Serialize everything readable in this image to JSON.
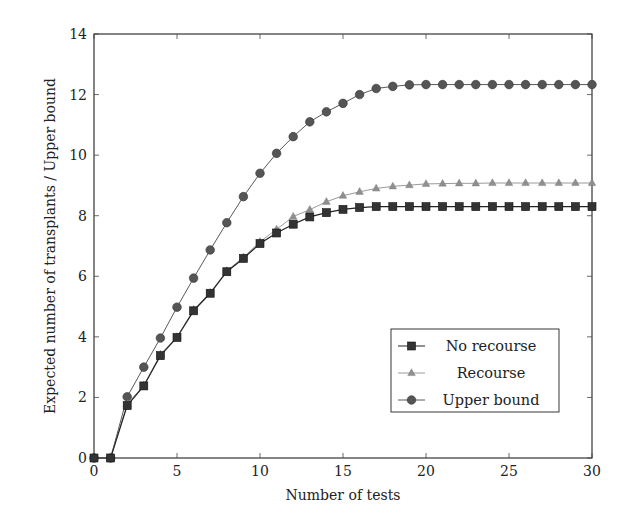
{
  "chart_data": {
    "type": "line",
    "title": "",
    "xlabel": "Number of tests",
    "ylabel": "Expected number of transplants / Upper bound",
    "xlim": [
      0,
      30
    ],
    "ylim": [
      0,
      14
    ],
    "xticks": [
      0,
      5,
      10,
      15,
      20,
      25,
      30
    ],
    "yticks": [
      0,
      2,
      4,
      6,
      8,
      10,
      12,
      14
    ],
    "grid": false,
    "legend_position": "lower right",
    "x": [
      0,
      1,
      2,
      3,
      4,
      5,
      6,
      7,
      8,
      9,
      10,
      11,
      12,
      13,
      14,
      15,
      16,
      17,
      18,
      19,
      20,
      21,
      22,
      23,
      24,
      25,
      26,
      27,
      28,
      29,
      30
    ],
    "series": [
      {
        "name": "No recourse",
        "marker": "square",
        "color": "#222222",
        "marker_color": "#333333",
        "values": [
          0,
          0,
          1.73,
          2.38,
          3.38,
          3.98,
          4.86,
          5.44,
          6.15,
          6.59,
          7.08,
          7.43,
          7.72,
          7.96,
          8.1,
          8.21,
          8.27,
          8.3,
          8.3,
          8.3,
          8.3,
          8.3,
          8.3,
          8.3,
          8.3,
          8.3,
          8.3,
          8.3,
          8.3,
          8.3,
          8.3
        ]
      },
      {
        "name": "Recourse",
        "marker": "triangle",
        "color": "#9a9a9a",
        "marker_color": "#8f8f8f",
        "values": [
          0,
          0,
          1.78,
          2.4,
          3.42,
          4.0,
          4.9,
          5.46,
          6.18,
          6.63,
          7.14,
          7.55,
          7.97,
          8.2,
          8.46,
          8.66,
          8.79,
          8.9,
          8.97,
          9.01,
          9.05,
          9.06,
          9.07,
          9.07,
          9.08,
          9.08,
          9.08,
          9.08,
          9.08,
          9.08,
          9.08
        ]
      },
      {
        "name": "Upper bound",
        "marker": "circle",
        "color": "#5a5a5a",
        "marker_color": "#555555",
        "values": [
          0,
          0,
          2.02,
          3.0,
          3.96,
          4.98,
          5.94,
          6.87,
          7.77,
          8.63,
          9.4,
          10.06,
          10.61,
          11.1,
          11.43,
          11.71,
          12.0,
          12.2,
          12.27,
          12.32,
          12.33,
          12.33,
          12.33,
          12.33,
          12.33,
          12.33,
          12.33,
          12.33,
          12.33,
          12.33,
          12.33
        ]
      }
    ]
  },
  "plot_area": {
    "left": 94,
    "top": 34,
    "right": 592,
    "bottom": 458
  },
  "legend": {
    "left": 391,
    "top": 329,
    "width": 168,
    "height": 83
  }
}
